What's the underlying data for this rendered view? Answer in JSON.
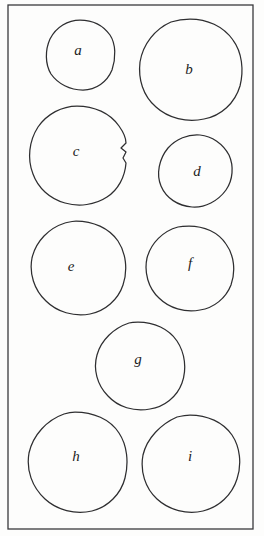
{
  "figure": {
    "background_color": "#fdfdfc",
    "ink_color": "#2e2e30",
    "frame_color": "#3a3a3c",
    "label_color": "#1d1d1f"
  },
  "frame": {
    "x": 8,
    "y": 5,
    "width": 245,
    "height": 524
  },
  "chart_data": {
    "type": "diagram",
    "xlabel": "",
    "ylabel": "",
    "grid": false,
    "legend": false,
    "region_count": 9,
    "labels": [
      "a",
      "b",
      "c",
      "d",
      "e",
      "f",
      "g",
      "h",
      "i"
    ]
  },
  "regions": [
    {
      "id": "region-a",
      "label": "a",
      "label_x": 78,
      "label_y": 52,
      "center_x": 80,
      "center_y": 55,
      "approx_radius": 35,
      "notched": false,
      "path": "M 80 20 C 92 20 103 25 110 35 C 116 44 116 58 112 70 C 107 82 96 90 83 90 C 70 90 58 84 51 74 C 45 64 45 50 50 39 C 56 27 68 20 80 20 Z"
    },
    {
      "id": "region-b",
      "label": "b",
      "label_x": 189,
      "label_y": 71,
      "center_x": 190,
      "center_y": 70,
      "approx_radius": 50,
      "notched": false,
      "path": "M 190 19 C 207 19 223 26 233 40 C 242 52 244 70 240 86 C 235 103 221 116 204 119 C 187 123 168 118 156 107 C 143 96 138 79 140 62 C 143 44 155 29 171 22 C 177 20 184 19 190 19 Z"
    },
    {
      "id": "region-c",
      "label": "c",
      "label_x": 76,
      "label_y": 153,
      "center_x": 77,
      "center_y": 153,
      "approx_radius": 47,
      "notched": true,
      "path": "M 77 106 C 94 106 110 113 119 126 C 124 133 126 139 126 143 L 121 148 L 126 152 L 123 158 L 126 163 C 125 177 118 190 107 197 C 95 205 79 207 65 203 C 50 199 38 188 33 174 C 27 159 29 141 38 127 C 47 114 62 106 77 106 Z"
    },
    {
      "id": "region-d",
      "label": "d",
      "label_x": 197,
      "label_y": 173,
      "center_x": 196,
      "center_y": 171,
      "approx_radius": 36,
      "notched": false,
      "path": "M 200 135 C 212 136 223 144 229 155 C 234 166 233 180 226 190 C 218 201 205 208 192 207 C 178 206 166 198 161 186 C 156 174 159 159 168 148 C 176 139 188 134 200 135 Z"
    },
    {
      "id": "region-e",
      "label": "e",
      "label_x": 71,
      "label_y": 268,
      "center_x": 76,
      "center_y": 267,
      "approx_radius": 44,
      "notched": false,
      "path": "M 76 221 C 93 221 109 228 118 241 C 126 253 128 270 123 285 C 118 300 105 311 90 314 C 74 317 57 312 46 301 C 34 290 29 273 32 258 C 36 241 49 228 65 223 C 69 222 72 221 76 221 Z"
    },
    {
      "id": "region-f",
      "label": "f",
      "label_x": 190,
      "label_y": 265,
      "center_x": 189,
      "center_y": 267,
      "approx_radius": 41,
      "notched": false,
      "path": "M 189 226 C 204 226 218 232 226 244 C 234 255 236 271 231 285 C 226 298 214 308 200 310 C 185 313 169 308 159 298 C 148 288 144 272 147 258 C 151 243 163 231 178 227 C 182 226 186 226 189 226 Z"
    },
    {
      "id": "region-g",
      "label": "g",
      "label_x": 138,
      "label_y": 361,
      "center_x": 138,
      "center_y": 366,
      "approx_radius": 44,
      "notched": false,
      "path": "M 138 322 C 154 322 169 329 177 341 C 185 353 187 369 182 383 C 177 397 164 407 150 409 C 134 412 118 407 108 396 C 97 385 93 369 97 355 C 101 340 114 328 129 323 C 132 322 135 322 138 322 Z"
    },
    {
      "id": "region-h",
      "label": "h",
      "label_x": 76,
      "label_y": 458,
      "center_x": 75,
      "center_y": 462,
      "approx_radius": 50,
      "notched": false,
      "path": "M 75 412 C 93 412 110 419 119 433 C 127 445 129 462 125 478 C 121 494 108 507 92 511 C 75 515 57 510 45 499 C 32 487 26 470 29 453 C 33 435 47 420 64 414 C 67 413 71 412 75 412 Z"
    },
    {
      "id": "region-i",
      "label": "i",
      "label_x": 190,
      "label_y": 458,
      "center_x": 190,
      "center_y": 463,
      "approx_radius": 48,
      "notched": false,
      "path": "M 190 415 C 207 415 223 422 232 435 C 240 447 242 464 237 479 C 232 495 219 507 203 511 C 187 515 169 510 157 499 C 145 488 140 471 143 455 C 147 438 161 424 177 417 C 181 416 186 415 190 415 Z"
    }
  ]
}
